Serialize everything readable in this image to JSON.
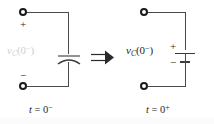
{
  "figure": {
    "name": "capacitor-initial-condition-equivalence",
    "background_color": "#ffffff",
    "wire_color": "#4a4a4a",
    "terminal_color": "#1a1a1a",
    "faded_label_color": "#cfcfcf",
    "relation_symbol": "⇒",
    "relation_name": "implies-double-arrow"
  },
  "left_circuit": {
    "name": "charged-capacitor-circuit",
    "caption": "t = 0",
    "caption_superscript": "−",
    "caption_variable": "t",
    "caption_equals": "=",
    "caption_value": "0",
    "voltage_label": {
      "symbol": "v",
      "subscript": "C",
      "open_paren": "(",
      "argument": "0",
      "argument_superscript": "−",
      "close_paren": ")",
      "full": "v_C(0−)",
      "state": "faded"
    },
    "plus_terminal": "+",
    "minus_terminal": "−",
    "element": "capacitor",
    "element_icon": "capacitor-curved-plate-icon"
  },
  "right_circuit": {
    "name": "equivalent-voltage-source-circuit",
    "caption": "t = 0",
    "caption_superscript": "+",
    "caption_variable": "t",
    "caption_equals": "=",
    "caption_value": "0",
    "voltage_label": {
      "symbol": "v",
      "subscript": "C",
      "open_paren": "(",
      "argument": "0",
      "argument_superscript": "−",
      "close_paren": ")",
      "full": "v_C(0−)",
      "state": "normal"
    },
    "source_plus": "+",
    "source_minus": "−",
    "element": "dc-voltage-source",
    "element_icon": "battery-icon"
  }
}
